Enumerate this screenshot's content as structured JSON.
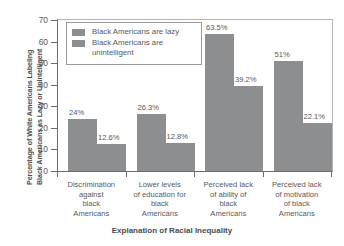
{
  "chart_data": {
    "type": "bar",
    "title": "",
    "xlabel": "Explanation of Racial Inequality",
    "ylabel": "Percentage of White Americans Labeling Black Americans as Lazy or Unintelligent",
    "ylabel_lines": [
      "Percentage of White Americans Labeling",
      "Black Americans as Lazy or Unintelligent"
    ],
    "ylim": [
      0,
      70
    ],
    "yticks": [
      0,
      10,
      20,
      30,
      40,
      50,
      60,
      70
    ],
    "ytick_labels": [
      "0",
      "10",
      "20",
      "30",
      "40",
      "50",
      "60",
      "70"
    ],
    "grid": false,
    "legend_position": "top-left",
    "categories": [
      "Discrimination against black Americans",
      "Lower levels of education for black Americans",
      "Perceived lack of ability of black Americans",
      "Perceived lack of motivation of black Americans"
    ],
    "category_lines": [
      [
        "Discrimination",
        "against",
        "black",
        "Americans"
      ],
      [
        "Lower levels",
        "of education for",
        "black",
        "Americans"
      ],
      [
        "Perceived lack",
        "of ability of",
        "black",
        "Americans"
      ],
      [
        "Perceived lack",
        "of motivation",
        "of black",
        "Americans"
      ]
    ],
    "series": [
      {
        "name": "Black Americans are lazy",
        "color": "#8d8e90",
        "values": [
          24,
          26.3,
          63.5,
          51
        ],
        "labels": [
          "24%",
          "26.3%",
          "63.5%",
          "51%"
        ]
      },
      {
        "name": "Black Americans are unintelligent",
        "color": "#8d8e90",
        "values": [
          12.6,
          12.8,
          39.2,
          22.1
        ],
        "labels": [
          "12.6%",
          "12.8%",
          "39.2%",
          "22.1%"
        ]
      }
    ]
  },
  "legend": {
    "items": [
      {
        "label": "Black Americans are lazy",
        "color": "#8d8e90"
      },
      {
        "label": "Black Americans are unintelligent",
        "color": "#8d8e90"
      }
    ]
  },
  "colors": {
    "bar": "#8d8e90",
    "axis": "#6d6e71",
    "frame": "#b5b5b5",
    "text": "#58595b",
    "background": "#ffffff"
  }
}
